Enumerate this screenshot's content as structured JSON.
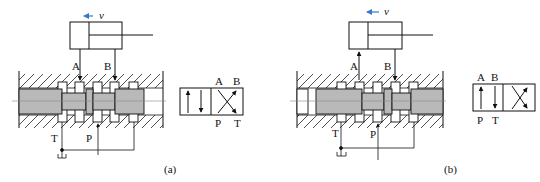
{
  "figure": {
    "panels": [
      {
        "id": "a",
        "caption": "(a)",
        "cylinder": {
          "velocity_label": "v",
          "velocity_arrow": "left"
        },
        "valve_ports_top": [
          "A",
          "B"
        ],
        "valve_ports_bottom": [
          "T",
          "P"
        ],
        "symbol": {
          "top_labels": [
            "A",
            "B"
          ],
          "bottom_labels": [
            "P",
            "T"
          ],
          "active_position": "right (crossed)"
        }
      },
      {
        "id": "b",
        "caption": "(b)",
        "cylinder": {
          "velocity_label": "v",
          "velocity_arrow": "left"
        },
        "valve_ports_top": [
          "A",
          "B"
        ],
        "valve_ports_bottom": [
          "T",
          "P"
        ],
        "symbol": {
          "top_labels": [
            "A",
            "B"
          ],
          "bottom_labels": [
            "P",
            "T"
          ],
          "active_position": "left (parallel)"
        }
      }
    ],
    "colors": {
      "line": "#111111",
      "spool_fill": "#b9b9b9",
      "velocity_arrow": "#3a78c9"
    }
  }
}
